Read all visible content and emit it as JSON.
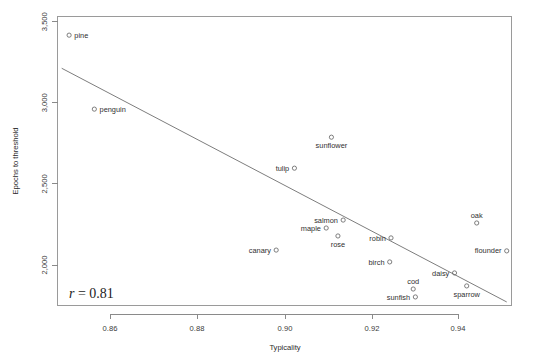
{
  "chart_data": {
    "type": "scatter",
    "title": "",
    "xlabel": "Typicality",
    "ylabel": "Epochs to threshold",
    "xlim": [
      0.8489,
      0.9512
    ],
    "ylim": [
      1753,
      3500
    ],
    "grid": false,
    "legend": "none",
    "annotations": [
      {
        "name": "correlation",
        "text_italic": "r",
        "text": " = 0.81",
        "x": 0.8535,
        "y": 1840
      }
    ],
    "xticks": [
      0.86,
      0.88,
      0.9,
      0.92,
      0.94
    ],
    "xtick_labels": [
      "0.86",
      "0.88",
      "0.90",
      "0.92",
      "0.94"
    ],
    "yticks": [
      2000,
      2500,
      3000,
      3500
    ],
    "ytick_labels": [
      "2,000",
      "2,500",
      "3,000",
      "3,500"
    ],
    "points": [
      {
        "label": "pine",
        "x": 0.8506,
        "y": 3417,
        "label_side": "right"
      },
      {
        "label": "penguin",
        "x": 0.8564,
        "y": 2961,
        "label_side": "right"
      },
      {
        "label": "sunflower",
        "x": 0.9109,
        "y": 2788,
        "label_side": "below"
      },
      {
        "label": "tulip",
        "x": 0.9024,
        "y": 2597,
        "label_side": "left"
      },
      {
        "label": "oak",
        "x": 0.9443,
        "y": 2259,
        "label_side": "above"
      },
      {
        "label": "salmon",
        "x": 0.9136,
        "y": 2277,
        "label_side": "left"
      },
      {
        "label": "maple",
        "x": 0.9097,
        "y": 2228,
        "label_side": "left"
      },
      {
        "label": "rose",
        "x": 0.9124,
        "y": 2179,
        "label_side": "below"
      },
      {
        "label": "robin",
        "x": 0.9246,
        "y": 2167,
        "label_side": "left"
      },
      {
        "label": "flounder",
        "x": 0.9512,
        "y": 2087,
        "label_side": "left"
      },
      {
        "label": "canary",
        "x": 0.8982,
        "y": 2092,
        "label_side": "left"
      },
      {
        "label": "birch",
        "x": 0.9243,
        "y": 2019,
        "label_side": "left"
      },
      {
        "label": "daisy",
        "x": 0.9392,
        "y": 1951,
        "label_side": "left"
      },
      {
        "label": "cod",
        "x": 0.9297,
        "y": 1852,
        "label_side": "above"
      },
      {
        "label": "sparrow",
        "x": 0.942,
        "y": 1871,
        "label_side": "below"
      },
      {
        "label": "sunfish",
        "x": 0.9302,
        "y": 1803,
        "label_side": "left"
      }
    ],
    "fit_line": {
      "name": "regression-line",
      "x_start": 0.8489,
      "y_start": 3213,
      "x_end": 0.9512,
      "y_end": 1772
    }
  }
}
